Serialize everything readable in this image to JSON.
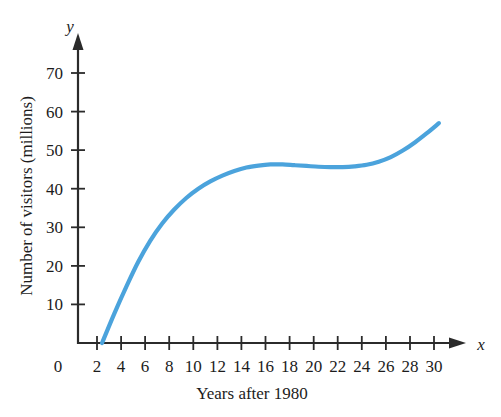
{
  "chart_data": {
    "type": "line",
    "title": "",
    "xlabel": "Years after 1980",
    "ylabel": "Number of visitors (millions)",
    "x_axis_letter": "x",
    "y_axis_letter": "y",
    "xlim": [
      0,
      31
    ],
    "ylim": [
      0,
      75
    ],
    "grid": false,
    "legend": null,
    "series_color": "#4BA3DC",
    "x_ticks": [
      0,
      2,
      4,
      6,
      8,
      10,
      12,
      14,
      16,
      18,
      20,
      22,
      24,
      26,
      28,
      30
    ],
    "x_tick_labels": [
      "0",
      "2",
      "4",
      "6",
      "8",
      "10",
      "12",
      "14",
      "16",
      "18",
      "20",
      "22",
      "24",
      "26",
      "28",
      "30"
    ],
    "y_ticks": [
      10,
      20,
      30,
      40,
      50,
      60,
      70
    ],
    "y_tick_labels": [
      "10",
      "20",
      "30",
      "40",
      "50",
      "60",
      "70"
    ],
    "x": [
      2,
      3,
      4,
      5,
      6,
      7,
      8,
      9,
      10,
      11,
      12,
      13,
      14,
      15,
      16,
      17,
      18,
      19,
      20,
      21,
      22,
      23,
      24,
      25,
      26,
      27,
      28,
      29,
      30
    ],
    "values": [
      0,
      7.5,
      14.5,
      21.0,
      26.5,
      31.0,
      34.6,
      37.6,
      40.0,
      41.9,
      43.4,
      44.6,
      45.5,
      46.0,
      46.3,
      46.3,
      46.1,
      45.9,
      45.7,
      45.6,
      45.6,
      45.8,
      46.2,
      47.0,
      48.2,
      49.9,
      52.0,
      54.4,
      57.0
    ],
    "series_name": "Number of visitors"
  },
  "figure": {
    "x_axis_title": "Years after 1980",
    "y_axis_title": "Number of visitors (millions)",
    "x_letter": "x",
    "y_letter": "y"
  }
}
